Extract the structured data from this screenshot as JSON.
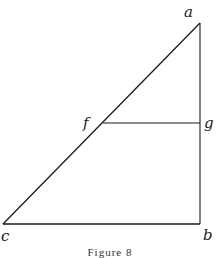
{
  "figure": {
    "caption": "Figure 8",
    "stroke_color": "#1a1a1a",
    "points": {
      "a": {
        "label": "a",
        "x": 200,
        "y": 23
      },
      "b": {
        "label": "b",
        "x": 200,
        "y": 224
      },
      "c": {
        "label": "c",
        "x": 3,
        "y": 224
      },
      "f": {
        "label": "f",
        "x": 103,
        "y": 123
      },
      "g": {
        "label": "g",
        "x": 200,
        "y": 123
      }
    },
    "segments": [
      {
        "from": "a",
        "to": "c"
      },
      {
        "from": "a",
        "to": "b"
      },
      {
        "from": "c",
        "to": "b"
      },
      {
        "from": "f",
        "to": "g"
      }
    ]
  }
}
